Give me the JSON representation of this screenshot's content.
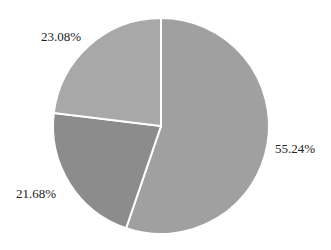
{
  "chart_data": {
    "type": "pie",
    "title": "",
    "categories": [
      "Slice A",
      "Slice B",
      "Slice C"
    ],
    "values": [
      55.24,
      21.68,
      23.08
    ],
    "labels": [
      "55.24%",
      "21.68%",
      "23.08%"
    ],
    "colors": [
      "#a0a0a0",
      "#8c8c8c",
      "#a8a8a8"
    ],
    "start_angle": "12 o'clock",
    "direction": "clockwise",
    "legend": "none"
  }
}
